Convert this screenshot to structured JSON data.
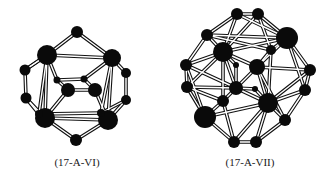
{
  "figures": [
    {
      "id": "17-A-VI",
      "caption": "(17-A-VI)",
      "caption_x": 77,
      "atoms": [
        {
          "x": 77,
          "y": 32,
          "r": 6
        },
        {
          "x": 47,
          "y": 55,
          "r": 10
        },
        {
          "x": 112,
          "y": 58,
          "r": 9
        },
        {
          "x": 25,
          "y": 70,
          "r": 5.5
        },
        {
          "x": 26,
          "y": 98,
          "r": 5.5
        },
        {
          "x": 126,
          "y": 73,
          "r": 5
        },
        {
          "x": 126,
          "y": 100,
          "r": 5
        },
        {
          "x": 57,
          "y": 80,
          "r": 3.5
        },
        {
          "x": 84,
          "y": 79,
          "r": 3.5
        },
        {
          "x": 68,
          "y": 90,
          "r": 7
        },
        {
          "x": 95,
          "y": 90,
          "r": 7
        },
        {
          "x": 45,
          "y": 118,
          "r": 10
        },
        {
          "x": 108,
          "y": 120,
          "r": 10
        },
        {
          "x": 76,
          "y": 140,
          "r": 6
        },
        {
          "x": 39,
          "y": 114,
          "r": 4
        },
        {
          "x": 101,
          "y": 113,
          "r": 4
        }
      ],
      "bonds": [
        [
          0,
          1
        ],
        [
          0,
          2
        ],
        [
          1,
          2
        ],
        [
          1,
          3
        ],
        [
          3,
          4
        ],
        [
          4,
          11
        ],
        [
          2,
          5
        ],
        [
          5,
          6
        ],
        [
          6,
          12
        ],
        [
          11,
          13
        ],
        [
          12,
          13
        ],
        [
          11,
          12
        ],
        [
          1,
          11
        ],
        [
          2,
          12
        ],
        [
          1,
          7
        ],
        [
          2,
          8
        ],
        [
          7,
          8
        ],
        [
          7,
          9
        ],
        [
          8,
          10
        ],
        [
          9,
          10
        ],
        [
          9,
          11
        ],
        [
          10,
          12
        ],
        [
          14,
          11
        ],
        [
          15,
          12
        ],
        [
          14,
          4
        ],
        [
          15,
          6
        ],
        [
          1,
          14
        ],
        [
          2,
          15
        ],
        [
          3,
          1
        ],
        [
          14,
          15
        ]
      ]
    },
    {
      "id": "17-A-VII",
      "caption": "(17-A-VII)",
      "caption_x": 250,
      "atoms": [
        {
          "x": 237,
          "y": 14,
          "r": 6
        },
        {
          "x": 258,
          "y": 14,
          "r": 6
        },
        {
          "x": 207,
          "y": 35,
          "r": 6
        },
        {
          "x": 287,
          "y": 38,
          "r": 11
        },
        {
          "x": 223,
          "y": 52,
          "r": 10
        },
        {
          "x": 271,
          "y": 50,
          "r": 5
        },
        {
          "x": 257,
          "y": 67,
          "r": 8
        },
        {
          "x": 186,
          "y": 65,
          "r": 6
        },
        {
          "x": 187,
          "y": 87,
          "r": 6
        },
        {
          "x": 310,
          "y": 70,
          "r": 6
        },
        {
          "x": 305,
          "y": 90,
          "r": 6
        },
        {
          "x": 236,
          "y": 65,
          "r": 3
        },
        {
          "x": 255,
          "y": 89,
          "r": 3
        },
        {
          "x": 236,
          "y": 88,
          "r": 7
        },
        {
          "x": 268,
          "y": 103,
          "r": 10
        },
        {
          "x": 223,
          "y": 101,
          "r": 6
        },
        {
          "x": 205,
          "y": 117,
          "r": 11
        },
        {
          "x": 285,
          "y": 120,
          "r": 6
        },
        {
          "x": 234,
          "y": 142,
          "r": 6
        },
        {
          "x": 256,
          "y": 142,
          "r": 6
        }
      ],
      "bonds": [
        [
          0,
          1
        ],
        [
          0,
          2
        ],
        [
          1,
          3
        ],
        [
          0,
          4
        ],
        [
          1,
          4
        ],
        [
          0,
          3
        ],
        [
          1,
          5
        ],
        [
          2,
          4
        ],
        [
          2,
          7
        ],
        [
          3,
          5
        ],
        [
          3,
          9
        ],
        [
          3,
          6
        ],
        [
          4,
          6
        ],
        [
          4,
          7
        ],
        [
          4,
          8
        ],
        [
          4,
          13
        ],
        [
          4,
          15
        ],
        [
          4,
          3
        ],
        [
          5,
          6
        ],
        [
          5,
          14
        ],
        [
          6,
          14
        ],
        [
          6,
          13
        ],
        [
          6,
          9
        ],
        [
          7,
          8
        ],
        [
          7,
          16
        ],
        [
          8,
          16
        ],
        [
          8,
          13
        ],
        [
          9,
          10
        ],
        [
          9,
          14
        ],
        [
          10,
          14
        ],
        [
          10,
          17
        ],
        [
          11,
          13
        ],
        [
          11,
          4
        ],
        [
          12,
          14
        ],
        [
          12,
          13
        ],
        [
          13,
          15
        ],
        [
          13,
          14
        ],
        [
          14,
          17
        ],
        [
          14,
          19
        ],
        [
          14,
          18
        ],
        [
          15,
          16
        ],
        [
          15,
          18
        ],
        [
          16,
          18
        ],
        [
          17,
          19
        ],
        [
          18,
          19
        ],
        [
          2,
          3
        ],
        [
          8,
          15
        ],
        [
          10,
          3
        ],
        [
          16,
          14
        ],
        [
          17,
          6
        ],
        [
          2,
          5
        ],
        [
          7,
          13
        ]
      ]
    }
  ],
  "colors": {
    "atom": "#0a0a0a",
    "bond_outline": "#111111",
    "bond_fill": "#ffffff",
    "background": "#ffffff"
  }
}
